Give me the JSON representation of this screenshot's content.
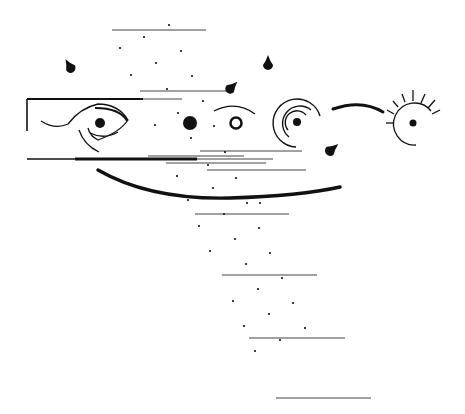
{
  "canvas": {
    "width": 465,
    "height": 414,
    "background": "#ffffff",
    "ink": "#111111",
    "thin_ink": "#444444"
  },
  "thin_lines": [
    [
      112,
      30,
      206,
      30
    ],
    [
      140,
      91,
      232,
      91
    ],
    [
      142,
      99,
      182,
      99
    ],
    [
      200,
      151,
      302,
      151
    ],
    [
      148,
      156,
      244,
      156
    ],
    [
      170,
      159,
      273,
      159
    ],
    [
      166,
      163,
      266,
      163
    ],
    [
      207,
      170,
      306,
      170
    ],
    [
      195,
      214,
      289,
      214
    ],
    [
      222,
      275,
      317,
      275
    ],
    [
      249,
      338,
      345,
      338
    ],
    [
      276,
      398,
      371,
      398
    ]
  ],
  "thick_lines": [
    {
      "pts": [
        27,
        99,
        143,
        99
      ],
      "w": 2.2
    },
    {
      "pts": [
        27,
        99,
        27,
        131
      ],
      "w": 1.6
    },
    {
      "pts": [
        27,
        159,
        75,
        159
      ],
      "w": 1.6
    },
    {
      "pts": [
        75,
        159,
        197,
        159
      ],
      "w": 3.2
    }
  ],
  "dots": [
    [
      169,
      25
    ],
    [
      144,
      37
    ],
    [
      120,
      48
    ],
    [
      181,
      51
    ],
    [
      156,
      63
    ],
    [
      131,
      75
    ],
    [
      192,
      76
    ],
    [
      167,
      89
    ],
    [
      203,
      101
    ],
    [
      178,
      113
    ],
    [
      191,
      138
    ],
    [
      155,
      125
    ],
    [
      214,
      126
    ],
    [
      225,
      152
    ],
    [
      208,
      165
    ],
    [
      177,
      176
    ],
    [
      236,
      178
    ],
    [
      213,
      188
    ],
    [
      188,
      200
    ],
    [
      247,
      203
    ],
    [
      224,
      214
    ],
    [
      260,
      203
    ],
    [
      199,
      226
    ],
    [
      259,
      228
    ],
    [
      235,
      239
    ],
    [
      210,
      251
    ],
    [
      270,
      253
    ],
    [
      246,
      264
    ],
    [
      282,
      278
    ],
    [
      258,
      289
    ],
    [
      233,
      301
    ],
    [
      293,
      303
    ],
    [
      269,
      314
    ],
    [
      244,
      326
    ],
    [
      305,
      328
    ],
    [
      280,
      340
    ],
    [
      255,
      351
    ]
  ],
  "drops": [
    {
      "x": 70,
      "y": 67,
      "rot": -30,
      "s": 1.0
    },
    {
      "x": 268,
      "y": 64,
      "rot": 0,
      "s": 1.0
    },
    {
      "x": 231,
      "y": 88,
      "rot": 45,
      "s": 1.0
    },
    {
      "x": 331,
      "y": 150,
      "rot": 50,
      "s": 1.05
    }
  ],
  "eye": {
    "pupil": [
      100,
      123
    ],
    "pupil_r": 5
  },
  "solid_circle": {
    "cx": 190,
    "cy": 123,
    "r": 7
  },
  "ring": {
    "cx": 236,
    "cy": 123,
    "r": 5.5,
    "stroke": 2.5
  },
  "target": {
    "cx": 297,
    "cy": 122,
    "dot_r": 4
  },
  "sun": {
    "cx": 413,
    "cy": 123,
    "r": 21,
    "dot_r": 3.5
  },
  "big_arc": {
    "d": "M98 170 Q 150 200, 230 198 Q 300 196, 340 187",
    "w": 3.5
  },
  "small_arc": {
    "d": "M333 109 Q 362 99, 383 112",
    "w": 3
  }
}
